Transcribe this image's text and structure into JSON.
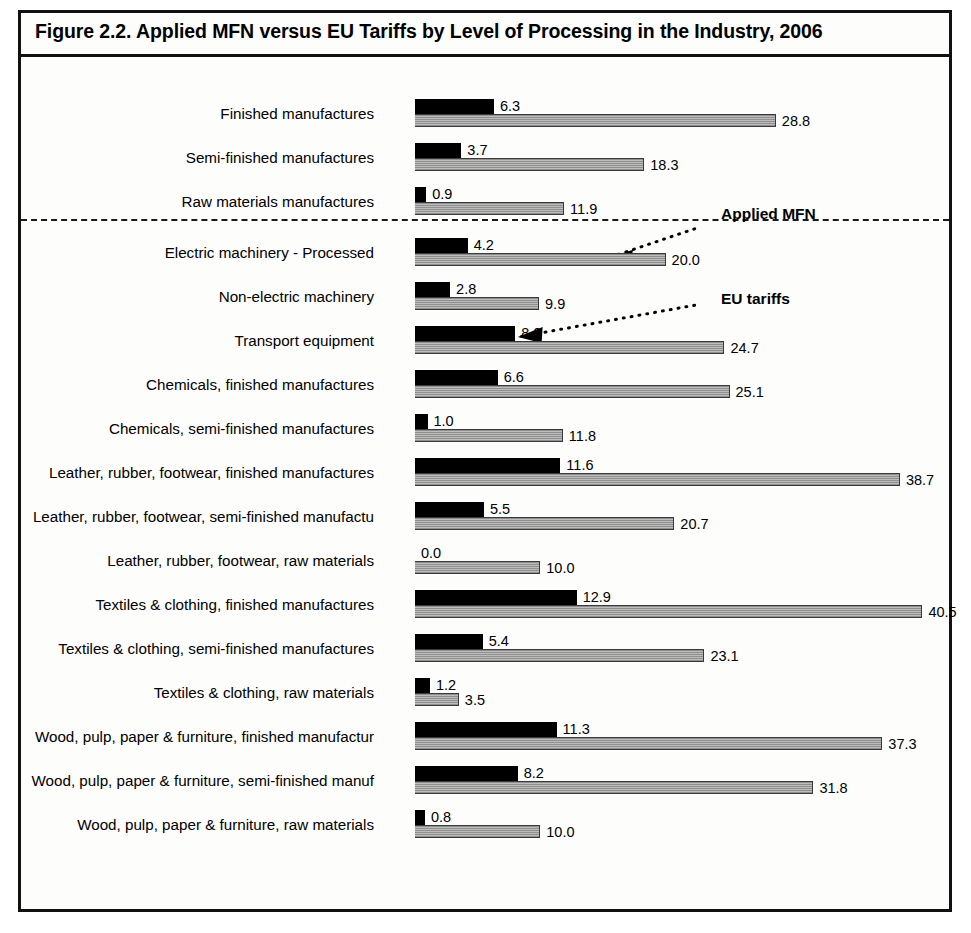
{
  "figure": {
    "title": "Figure 2.2.  Applied MFN versus EU Tariffs by Level of Processing in the Industry, 2006"
  },
  "annotations": {
    "applied_mfn_label": "Applied MFN",
    "eu_tariffs_label": "EU tariffs"
  },
  "chart_data": {
    "type": "bar",
    "orientation": "horizontal",
    "title": "Figure 2.2.  Applied MFN versus EU Tariffs by Level of Processing in the Industry, 2006",
    "xlabel": "",
    "ylabel": "",
    "xlim": [
      0,
      41
    ],
    "grid": false,
    "legend_position": "inline-annotation",
    "series": [
      {
        "name": "Applied MFN",
        "color": "#000000",
        "values": [
          6.3,
          3.7,
          0.9,
          4.2,
          2.8,
          8.0,
          6.6,
          1.0,
          11.6,
          5.5,
          0.0,
          12.9,
          5.4,
          1.2,
          11.3,
          8.2,
          0.8
        ]
      },
      {
        "name": "EU tariffs",
        "color": "#a8a8a8",
        "values": [
          28.8,
          18.3,
          11.9,
          20.0,
          9.9,
          24.7,
          25.1,
          11.8,
          38.7,
          20.7,
          10.0,
          40.5,
          23.1,
          3.5,
          37.3,
          31.8,
          10.0
        ]
      }
    ],
    "categories": [
      "Finished manufactures",
      "Semi-finished manufactures",
      "Raw materials manufactures",
      "Electric machinery - Processed",
      "Non-electric machinery",
      "Transport equipment",
      "Chemicals, finished manufactures",
      "Chemicals, semi-finished manufactures",
      "Leather, rubber, footwear, finished manufactures",
      "Leather, rubber, footwear, semi-finished manufactu",
      "Leather, rubber, footwear, raw materials",
      "Textiles & clothing, finished manufactures",
      "Textiles & clothing, semi-finished manufactures",
      "Textiles & clothing, raw materials",
      "Wood, pulp, paper & furniture, finished manufactur",
      "Wood, pulp, paper & furniture, semi-finished manuf",
      "Wood, pulp, paper & furniture, raw materials"
    ],
    "value_labels": {
      "mfn": [
        "6.3",
        "3.7",
        "0.9",
        "4.2",
        "2.8",
        "8.0",
        "6.6",
        "1.0",
        "11.6",
        "5.5",
        "0.0",
        "12.9",
        "5.4",
        "1.2",
        "11.3",
        "8.2",
        "0.8"
      ],
      "eu": [
        "28.8",
        "18.3",
        "11.9",
        "20.0",
        "9.9",
        "24.7",
        "25.1",
        "11.8",
        "38.7",
        "20.7",
        "10.0",
        "40.5",
        "23.1",
        "3.5",
        "37.3",
        "31.8",
        "10.0"
      ]
    },
    "separator_after_category_index": 2
  }
}
